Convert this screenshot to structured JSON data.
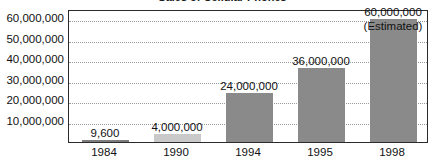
{
  "chart_data": {
    "type": "bar",
    "title": "Sales of Cellular Phones",
    "xlabel": "",
    "ylabel": "",
    "categories": [
      "1984",
      "1990",
      "1994",
      "1995",
      "1998"
    ],
    "values": [
      9600,
      4000000,
      24000000,
      36000000,
      60000000
    ],
    "data_labels": [
      "9,600",
      "4,000,000",
      "24,000,000",
      "36,000,000",
      "60,000,000"
    ],
    "annotations": [
      {
        "category": "1998",
        "text": "(Estimated)"
      }
    ],
    "ylim": [
      0,
      65000000
    ],
    "ytick_labels": [
      "60,000,000",
      "50,000,000",
      "40,000,000",
      "30,000,000",
      "20,000,000",
      "10,000,000"
    ],
    "ytick_values": [
      60000000,
      50000000,
      40000000,
      30000000,
      20000000,
      10000000
    ],
    "grid": true,
    "grid_style": "dotted",
    "legend": "none",
    "bar_colors": [
      "#7c7c7c",
      "#c9c9c9",
      "#8a8a8a",
      "#8a8a8a",
      "#8a8a8a"
    ],
    "plot_border_color": "#2b2b2b",
    "gridline_color": "#9a9a9a",
    "text_color": "#111111",
    "background_color": "#ffffff"
  }
}
